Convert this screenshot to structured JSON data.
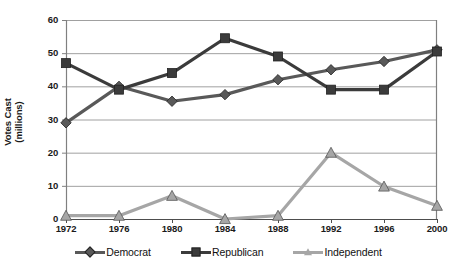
{
  "chart_data": {
    "type": "line",
    "title": "",
    "xlabel": "",
    "ylabel": "Votes Cast\n(millions)",
    "categories": [
      "1972",
      "1976",
      "1980",
      "1984",
      "1988",
      "1992",
      "1996",
      "2000"
    ],
    "ylim": [
      0,
      60
    ],
    "yticks": [
      "0",
      "10",
      "20",
      "30",
      "40",
      "50",
      "60"
    ],
    "grid": "horizontal",
    "legend_position": "bottom",
    "series": [
      {
        "name": "Democrat",
        "marker": "diamond",
        "color": "#595959",
        "values": [
          29,
          40,
          35.5,
          37.5,
          42,
          45,
          47.5,
          51
        ]
      },
      {
        "name": "Republican",
        "marker": "square",
        "color": "#3b3b3b",
        "values": [
          47,
          39,
          44,
          54.5,
          49,
          39,
          39,
          50.5
        ]
      },
      {
        "name": "Independent",
        "marker": "triangle",
        "color": "#a6a6a6",
        "values": [
          1,
          1,
          7,
          0,
          1,
          20,
          9.8,
          4
        ]
      }
    ]
  },
  "axis": {
    "y_label_line1": "Votes Cast",
    "y_label_line2": "(millions)"
  },
  "colors": {
    "democrat": "#595959",
    "republican": "#3b3b3b",
    "independent": "#a6a6a6",
    "gridline": "#a0a0a0",
    "axis": "#808080",
    "background": "#ffffff"
  }
}
